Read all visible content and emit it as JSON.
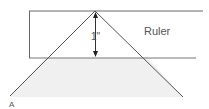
{
  "diagram": {
    "ruler_label": "Ruler",
    "dimension_label": "1\"",
    "point_label": "A",
    "colors": {
      "line": "#555555",
      "fill": "#efefef"
    }
  }
}
